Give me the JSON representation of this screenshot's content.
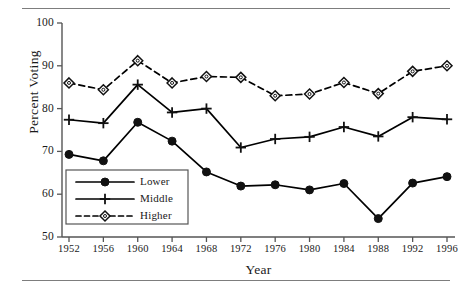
{
  "chart_data": {
    "type": "line",
    "title": "",
    "xlabel": "Year",
    "ylabel": "Percent Voting",
    "categories": [
      1952,
      1956,
      1960,
      1964,
      1968,
      1972,
      1976,
      1980,
      1984,
      1988,
      1992,
      1996
    ],
    "x_tick_labels": [
      "1952",
      "1956",
      "1960",
      "1964",
      "1968",
      "1972",
      "1976",
      "1980",
      "1984",
      "1988",
      "1992",
      "1996"
    ],
    "y_tick_labels": [
      "50",
      "60",
      "70",
      "80",
      "90",
      "100"
    ],
    "y_ticks": [
      50,
      60,
      70,
      80,
      90,
      100
    ],
    "ylim": [
      50,
      100
    ],
    "xlim": [
      1952,
      1996
    ],
    "grid": false,
    "legend_position": "lower left inside",
    "series": [
      {
        "name": "Lower",
        "marker": "filled-circle",
        "linestyle": "solid",
        "color": "#000000",
        "values": [
          69.3,
          67.8,
          76.8,
          72.4,
          65.2,
          61.9,
          62.2,
          61.0,
          62.5,
          54.3,
          62.6,
          64.1
        ]
      },
      {
        "name": "Middle",
        "marker": "plus",
        "linestyle": "solid",
        "color": "#000000",
        "values": [
          77.4,
          76.6,
          85.6,
          79.1,
          80.0,
          70.9,
          72.9,
          73.4,
          75.7,
          73.5,
          78.0,
          77.5
        ]
      },
      {
        "name": "Higher",
        "marker": "open-diamond",
        "linestyle": "dashed",
        "color": "#000000",
        "values": [
          86.0,
          84.4,
          91.2,
          86.0,
          87.5,
          87.3,
          83.0,
          83.4,
          86.1,
          83.5,
          88.7,
          90.0
        ]
      }
    ],
    "legend": [
      "Lower",
      "Middle",
      "Higher"
    ]
  },
  "legend": {
    "items": [
      {
        "label": "Lower"
      },
      {
        "label": "Middle"
      },
      {
        "label": "Higher"
      }
    ]
  },
  "axes": {
    "y_title": "Percent Voting",
    "x_title": "Year"
  }
}
